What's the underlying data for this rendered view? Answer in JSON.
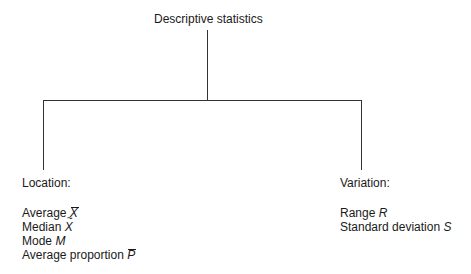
{
  "diagram": {
    "root": {
      "label": "Descriptive statistics"
    },
    "branches": [
      {
        "heading": "Location:",
        "items": [
          {
            "text": "Average",
            "symbol": "X",
            "mark": "bar"
          },
          {
            "text": "Median",
            "symbol": "X",
            "mark": "tilde"
          },
          {
            "text": "Mode",
            "symbol": "M",
            "mark": "none"
          },
          {
            "text": "Average proportion",
            "symbol": "P",
            "mark": "bar"
          }
        ]
      },
      {
        "heading": "Variation:",
        "items": [
          {
            "text": "Range",
            "symbol": "R",
            "mark": "none"
          },
          {
            "text": "Standard deviation",
            "symbol": "S",
            "mark": "none"
          }
        ]
      }
    ]
  }
}
